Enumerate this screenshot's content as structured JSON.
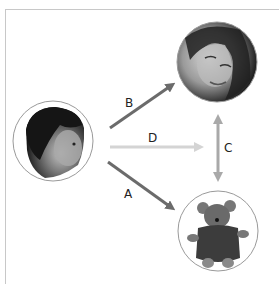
{
  "diagram": {
    "nodes": [
      {
        "id": "woman",
        "description": "photo of a smiling woman (caregiver)",
        "cx": 217,
        "cy": 62,
        "r": 40
      },
      {
        "id": "baby",
        "description": "photo of an infant",
        "cx": 53,
        "cy": 141,
        "r": 40
      },
      {
        "id": "teddy",
        "description": "photo of a teddy bear wearing a sweater",
        "cx": 218,
        "cy": 231,
        "r": 40
      }
    ],
    "edges": [
      {
        "label": "B",
        "from": "baby",
        "to": "woman",
        "color": "#6b6b6b",
        "direction": "one-way"
      },
      {
        "label": "D",
        "from": "baby",
        "to": "between woman and teddy",
        "color": "#d4d4d4",
        "direction": "one-way"
      },
      {
        "label": "C",
        "from": "woman",
        "to": "teddy",
        "color": "#a9a9a9",
        "direction": "two-way"
      },
      {
        "label": "A",
        "from": "baby",
        "to": "teddy",
        "color": "#6b6b6b",
        "direction": "one-way"
      }
    ],
    "labels": {
      "a": "A",
      "b": "B",
      "c": "C",
      "d": "D"
    }
  }
}
